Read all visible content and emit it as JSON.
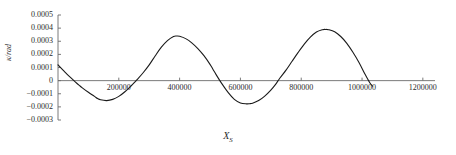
{
  "chart_data": {
    "type": "line",
    "title": "",
    "xlabel": "X_S",
    "xlabel_main": "X",
    "xlabel_sub": "S",
    "ylabel": "κ/rad",
    "xlim": [
      0,
      1240000
    ],
    "ylim": [
      -0.0003,
      0.0005
    ],
    "grid": false,
    "legend": null,
    "x_ticks": [
      {
        "value": 200000,
        "label": "200000"
      },
      {
        "value": 400000,
        "label": "400000"
      },
      {
        "value": 600000,
        "label": "600000"
      },
      {
        "value": 800000,
        "label": "800000"
      },
      {
        "value": 1000000,
        "label": "1000000"
      },
      {
        "value": 1200000,
        "label": "1200000"
      }
    ],
    "y_ticks": [
      {
        "value": 0.0005,
        "label": "0.0005"
      },
      {
        "value": 0.0004,
        "label": "0.0004"
      },
      {
        "value": 0.0003,
        "label": "0.0003"
      },
      {
        "value": 0.0002,
        "label": "0.0002"
      },
      {
        "value": 0.0001,
        "label": "0.0001"
      },
      {
        "value": 0,
        "label": "0"
      },
      {
        "value": -0.0001,
        "label": "−0.0001"
      },
      {
        "value": -0.0002,
        "label": "−0.0002"
      },
      {
        "value": -0.0003,
        "label": "−0.0003"
      }
    ],
    "series": [
      {
        "name": "kappa",
        "color": "#1a1a1a",
        "x": [
          0,
          20000,
          40000,
          60000,
          70000,
          80000,
          100000,
          120000,
          130000,
          140000,
          160000,
          180000,
          200000,
          220000,
          240000,
          250000,
          260000,
          280000,
          300000,
          320000,
          340000,
          360000,
          380000,
          390000,
          400000,
          420000,
          440000,
          460000,
          480000,
          500000,
          510000,
          520000,
          540000,
          560000,
          580000,
          600000,
          620000,
          630000,
          640000,
          660000,
          680000,
          700000,
          715000,
          730000,
          750000,
          770000,
          790000,
          810000,
          830000,
          850000,
          870000,
          880000,
          890000,
          910000,
          930000,
          950000,
          970000,
          990000,
          1010000,
          1025000,
          1035000
        ],
        "y": [
          0.00012,
          7.2e-05,
          2.6e-05,
          -1.6e-05,
          -3.6e-05,
          -5.5e-05,
          -8.9e-05,
          -0.00012,
          -0.000136,
          -0.000146,
          -0.000152,
          -0.000143,
          -0.00012,
          -8.5e-05,
          -4.1e-05,
          -1.8e-05,
          7e-06,
          6e-05,
          0.00012,
          0.00019,
          0.000255,
          0.000305,
          0.000336,
          0.00034,
          0.000338,
          0.00032,
          0.000288,
          0.000244,
          0.00019,
          0.000124,
          8.5e-05,
          4.6e-05,
          -2.7e-05,
          -9.2e-05,
          -0.000143,
          -0.00017,
          -0.000177,
          -0.000176,
          -0.000172,
          -0.000152,
          -0.000118,
          -7.2e-05,
          -3e-05,
          2e-05,
          8e-05,
          0.000148,
          0.000215,
          0.000278,
          0.000331,
          0.00037,
          0.000388,
          0.00039,
          0.000388,
          0.000372,
          0.000336,
          0.000284,
          0.000216,
          0.000138,
          4.8e-05,
          -1.4e-05,
          -4.2e-05
        ]
      }
    ]
  },
  "axes": {
    "axis_color": "#6b6b6b",
    "tick_color": "#6b6b6b",
    "spine_color": "#6b6b6b"
  }
}
